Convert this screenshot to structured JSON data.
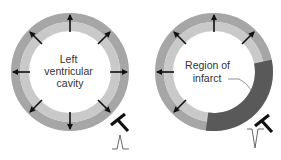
{
  "diagram": {
    "panels": [
      {
        "name": "normal",
        "label_lines": [
          "Left",
          "ventricular",
          "cavity"
        ],
        "ecg_wave": "upright-spike",
        "electrode": "T-shaped-electrode"
      },
      {
        "name": "infarct",
        "label_lines": [
          "Region of",
          "infarct"
        ],
        "ecg_wave": "inverted-spike",
        "electrode": "T-shaped-electrode"
      }
    ],
    "colors": {
      "outer_wall": "#a6a6a6",
      "inner_wall": "#c9c9c9",
      "infarct": "#595959",
      "arrows": "#111111",
      "text": "#333333"
    }
  }
}
